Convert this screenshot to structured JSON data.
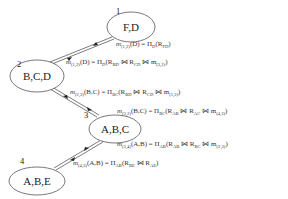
{
  "diagram": {
    "type": "junction-tree-message-passing",
    "nodes": [
      {
        "id": "1",
        "label": "F,D"
      },
      {
        "id": "2",
        "label": "B,C,D"
      },
      {
        "id": "3",
        "label": "A,B,C"
      },
      {
        "id": "4",
        "label": "A,B,E"
      }
    ],
    "edges": [
      {
        "from": "1",
        "to": "2"
      },
      {
        "from": "2",
        "to": "3"
      },
      {
        "from": "3",
        "to": "4"
      }
    ],
    "messages": [
      {
        "m": "m",
        "sub": "(1,2)",
        "args": "(D) = Π",
        "pi_sub": "D",
        "body_pre": "(R",
        "r1_sub": "FD",
        "body_post": ")"
      },
      {
        "m": "m",
        "sub": "(1,2)",
        "args": "(D) = Π",
        "pi_sub": "D",
        "body_pre": "(R",
        "r1_sub": "BD",
        "join1": " ⋈ R",
        "r2_sub": "CD",
        "join2": " ⋈ m",
        "m2_sub": "(3,2)",
        "body_post": ")"
      },
      {
        "m": "m",
        "sub": "(2,3)",
        "args": "(B,C) = Π",
        "pi_sub": "BC",
        "body_pre": "(R",
        "r1_sub": "BD",
        "join1": " ⋈ R",
        "r2_sub": "CD",
        "join2": " ⋈ m",
        "m2_sub": "(1,2)",
        "body_post": ")"
      },
      {
        "m": "m",
        "sub": "(3,2)",
        "args": "(B,C) = Π",
        "pi_sub": "BC",
        "body_pre": "(R",
        "r1_sub": "AB",
        "join1": " ⋈ R",
        "r2_sub": "AC",
        "join2": " ⋈ m",
        "m2_sub": "(4,3)",
        "body_post": ")"
      },
      {
        "m": "m",
        "sub": "(3,4)",
        "args": "(A,B) = Π",
        "pi_sub": "AB",
        "body_pre": "(R",
        "r1_sub": "AB",
        "join1": " ⋈ R",
        "r2_sub": "BC",
        "join2": " ⋈ m",
        "m2_sub": "(2,3)",
        "body_post": ")"
      },
      {
        "m": "m",
        "sub": "(4,3)",
        "args": "(A,B) = Π",
        "pi_sub": "AB",
        "body_pre": "(R",
        "r1_sub": "BE",
        "join1": " ⋈ R",
        "r2_sub": "AE",
        "body_post": ")"
      }
    ]
  }
}
